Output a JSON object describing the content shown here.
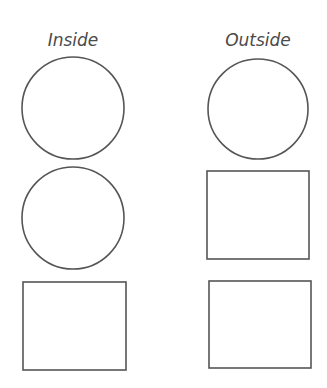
{
  "columns": [
    {
      "heading": "Inside",
      "shapes": [
        "circle",
        "circle",
        "square"
      ]
    },
    {
      "heading": "Outside",
      "shapes": [
        "circle",
        "square",
        "square"
      ]
    }
  ],
  "colors": {
    "stroke": "#555555",
    "background": "#ffffff",
    "text": "#4a4a4a"
  }
}
